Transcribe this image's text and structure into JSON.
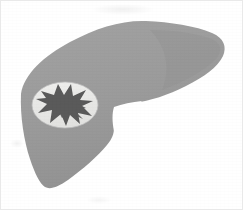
{
  "figure": {
    "title": "Liver anatomical illustration",
    "subject": "liver",
    "style": "grayscale line-free silhouette illustration",
    "background_color": "#ffffff",
    "frame_color": "#e9e9e9",
    "canvas": {
      "width": 243,
      "height": 210
    }
  },
  "colors": {
    "liver_fill": "#9b9b9b",
    "liver_shade": "#8f8f8f",
    "inset_fill": "#e8e8e6",
    "inset_edge": "#bdbdbd",
    "lesion_fill": "#5a5a5a",
    "background": "#ffffff"
  },
  "shapes": {
    "liver": {
      "name": "liver-silhouette",
      "fill": "#9b9b9b",
      "path": "M 21 94 C 24 74 44 56 70 42 C 96 28 122 20 146 21 C 170 22 196 26 212 33 C 224 38 227 47 223 56 C 218 67 204 77 186 86 C 168 95 150 101 134 103 C 128 104 122 106 118 111 C 115 115 114 121 114 128 C 114 134 112 139 107 145 C 98 156 82 170 68 180 C 58 187 50 190 45 187 C 40 184 35 174 30 159 C 24 141 20 116 21 94 Z"
    },
    "liver_notch": {
      "name": "liver-inferior-notch",
      "fill": "#ffffff",
      "path": "M 114 107 C 122 104 132 102 142 101 C 132 110 122 121 114 131 C 112 122 112 113 114 107 Z"
    },
    "inset_ellipse": {
      "name": "lesion-inset-ellipse",
      "fill": "#e8e8e6",
      "cx": 65,
      "cy": 105,
      "rx": 33,
      "ry": 23
    },
    "lesion": {
      "name": "lesion-star-shape",
      "fill": "#5a5a5a",
      "path": "M 41 91 L 54 95 L 58 84 L 64 95 L 71 84 L 73 96 L 86 90 L 80 100 L 93 101 L 82 106 L 92 116 L 78 113 L 80 124 L 70 115 L 66 126 L 61 114 L 50 123 L 52 110 L 38 113 L 47 104 L 36 99 L 46 98 Z"
    }
  },
  "annotations": {
    "smudges": [
      {
        "name": "scan-smudge-top",
        "x": 92,
        "y": 4
      },
      {
        "name": "scan-smudge-left",
        "x": 10,
        "y": 139
      },
      {
        "name": "scan-smudge-bottom",
        "x": 86,
        "y": 196
      }
    ]
  }
}
